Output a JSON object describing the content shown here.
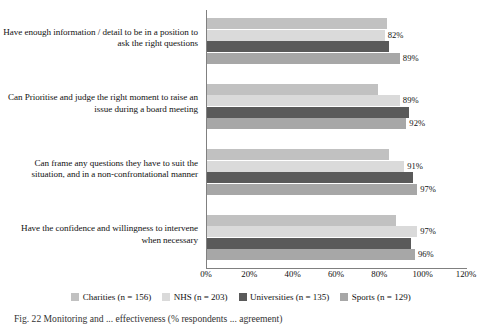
{
  "chart_data": {
    "type": "bar",
    "orientation": "horizontal",
    "title": "",
    "xlabel": "",
    "ylabel": "",
    "xlim": [
      0,
      120
    ],
    "xticks": [
      "0%",
      "20%",
      "40%",
      "60%",
      "80%",
      "100%",
      "120%"
    ],
    "xtick_values": [
      0,
      20,
      40,
      60,
      80,
      100,
      120
    ],
    "grid": false,
    "legend_position": "bottom",
    "categories": [
      "Have enough information / detail to be in a position to ask the right questions",
      "Can Prioritise and judge the right moment to raise an issue during a board meeting",
      "Can frame any questions they have to suit the situation, and in a non-confrontational manner",
      "Have the confidence and willingness to intervene when necessary"
    ],
    "series": [
      {
        "name": "Charities (n = 156)",
        "color": "#c1c1c1",
        "values": [
          83,
          79,
          84,
          87
        ],
        "labels": [
          "",
          "",
          "",
          ""
        ]
      },
      {
        "name": "NHS (n = 203)",
        "color": "#dadada",
        "values": [
          82,
          89,
          91,
          97
        ],
        "labels": [
          "82%",
          "89%",
          "91%",
          "97%"
        ]
      },
      {
        "name": "Universities (n = 135)",
        "color": "#5a5a5a",
        "values": [
          84,
          93,
          95,
          94
        ],
        "labels": [
          "",
          "",
          "",
          ""
        ]
      },
      {
        "name": "Sports (n = 129)",
        "color": "#a7a7a7",
        "values": [
          89,
          92,
          97,
          96
        ],
        "labels": [
          "89%",
          "92%",
          "97%",
          "96%"
        ]
      }
    ]
  },
  "legend": {
    "items": [
      {
        "label": "Charities (n = 156)",
        "color": "#c1c1c1"
      },
      {
        "label": "NHS (n = 203)",
        "color": "#dadada"
      },
      {
        "label": "Universities (n = 135)",
        "color": "#5a5a5a"
      },
      {
        "label": "Sports (n = 129)",
        "color": "#a7a7a7"
      }
    ]
  },
  "caption": {
    "text": "Fig. 22    Monitoring and ... effectiveness (% respondents ... agreement)"
  }
}
